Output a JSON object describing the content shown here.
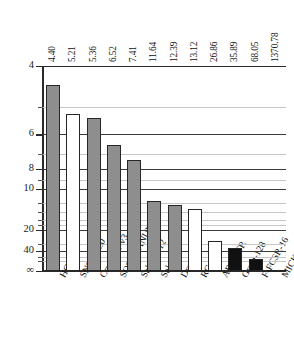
{
  "chart_data": {
    "type": "bar",
    "title": "",
    "xlabel": "",
    "ylabel": "",
    "grid": true,
    "legend": "none",
    "categories": [
      "HC-256",
      "SNOW-2.0",
      "CryptMT-v3",
      "SOSEMANUK",
      "Salsa20/12",
      "Salsa20",
      "Dragon",
      "RC4",
      "AES-CTR",
      "Grain-128",
      "F-FCSR-16",
      "MICKEY-128"
    ],
    "values": [
      4.4,
      5.21,
      5.36,
      6.52,
      7.41,
      11.64,
      12.39,
      13.12,
      26.86,
      35.89,
      68.05,
      1370.78
    ],
    "value_labels": [
      "4.40",
      "5.21",
      "5.36",
      "6.52",
      "7.41",
      "11.64",
      "12.39",
      "13.12",
      "26.86",
      "35.89",
      "68.05",
      "1370.78"
    ],
    "bar_styles": [
      "gray",
      "white",
      "gray",
      "gray",
      "gray",
      "gray",
      "gray",
      "white",
      "white",
      "black",
      "black",
      "black"
    ],
    "yticks_major": [
      "4",
      "6",
      "8",
      "10",
      "20",
      "40",
      "∞"
    ],
    "yticks_major_values": [
      4,
      6,
      8,
      10,
      20,
      40,
      100000
    ],
    "yticks_minor_values": [
      5,
      7,
      9,
      12,
      14,
      16,
      18,
      30,
      60,
      80
    ],
    "yaxis_scale": "reciprocal",
    "ylim": [
      4,
      100000
    ],
    "axis_note": "y-axis is inverted reciprocal: smaller values plot higher"
  },
  "caption": {
    "text": ""
  }
}
